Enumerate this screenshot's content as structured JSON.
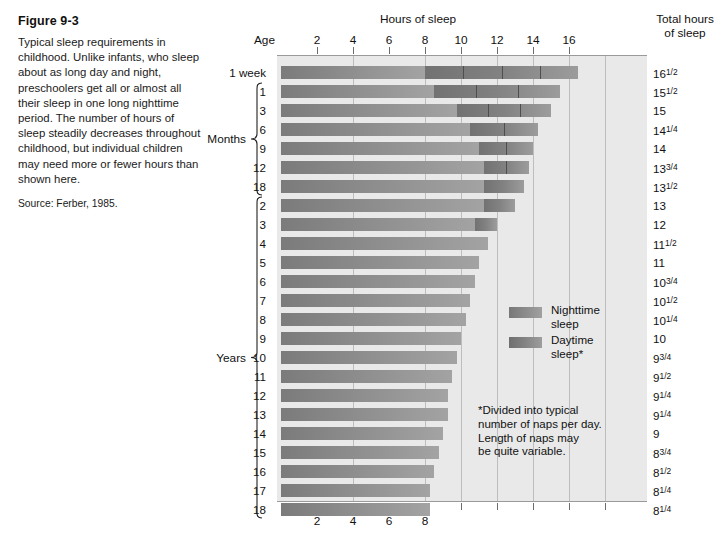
{
  "figure": {
    "title": "Figure 9-3",
    "body": "Typical sleep requirements in childhood. Unlike infants, who sleep about as long day and night, preschoolers get all or almost all their sleep in one long nighttime period. The number of hours of sleep steadily decreases throughout childhood, but individual children may need more or fewer hours than shown here.",
    "source": "Source: Ferber, 1985."
  },
  "headers": {
    "hours_of_sleep": "Hours of sleep",
    "age": "Age",
    "total_hours_line1": "Total hours",
    "total_hours_line2": "of sleep"
  },
  "legend": {
    "nighttime": "Nighttime\nsleep",
    "daytime": "Daytime\nsleep*"
  },
  "footnote": "*Divided into typical\nnumber of naps per day.\nLength of naps may\nbe quite variable.",
  "groups": [
    {
      "label": "Months",
      "first_row": 1,
      "last_row": 6
    },
    {
      "label": "Years",
      "first_row": 7,
      "last_row": 23
    }
  ],
  "colors": {
    "panel_background": "#e9e9e9",
    "nighttime_bar": "#8a8a8a",
    "daytime_bar": "#7d7d7d",
    "gridline": "#bdbdbd",
    "text": "#111111"
  },
  "chart_data": {
    "type": "bar",
    "title": "Hours of sleep",
    "xlabel": "Hours of sleep",
    "ylabel": "Age",
    "xlim": [
      0,
      20
    ],
    "xticks": [
      2,
      4,
      6,
      8,
      10,
      12,
      14,
      16
    ],
    "xticklabels": [
      "2",
      "4",
      "6",
      "8",
      "10",
      "12",
      "14",
      "16"
    ],
    "xticks_bottom": [
      2,
      4,
      6,
      8
    ],
    "xticklabels_bottom": [
      "2",
      "4",
      "6",
      "8"
    ],
    "grid": true,
    "stacked": true,
    "legend": [
      "Nighttime sleep",
      "Daytime sleep*"
    ],
    "legend_position": "center-right",
    "categories": [
      "1 week",
      "1",
      "3",
      "6",
      "9",
      "12",
      "18",
      "2",
      "3",
      "4",
      "5",
      "6",
      "7",
      "8",
      "9",
      "10",
      "11",
      "12",
      "13",
      "14",
      "15",
      "16",
      "17",
      "18"
    ],
    "rows": [
      {
        "age": "1 week",
        "unit": "weeks",
        "night": 8.0,
        "day": 8.5,
        "naps": 4,
        "total": 16.5,
        "total_label": "16",
        "total_frac_num": "1",
        "total_frac_den": "2"
      },
      {
        "age": "1",
        "unit": "months",
        "night": 8.5,
        "day": 7.0,
        "naps": 3,
        "total": 15.5,
        "total_label": "15",
        "total_frac_num": "1",
        "total_frac_den": "2"
      },
      {
        "age": "3",
        "unit": "months",
        "night": 9.75,
        "day": 5.25,
        "naps": 3,
        "total": 15.0,
        "total_label": "15",
        "total_frac_num": "",
        "total_frac_den": ""
      },
      {
        "age": "6",
        "unit": "months",
        "night": 10.5,
        "day": 3.75,
        "naps": 2,
        "total": 14.25,
        "total_label": "14",
        "total_frac_num": "1",
        "total_frac_den": "4"
      },
      {
        "age": "9",
        "unit": "months",
        "night": 11.0,
        "day": 3.0,
        "naps": 2,
        "total": 14.0,
        "total_label": "14",
        "total_frac_num": "",
        "total_frac_den": ""
      },
      {
        "age": "12",
        "unit": "months",
        "night": 11.25,
        "day": 2.5,
        "naps": 2,
        "total": 13.75,
        "total_label": "13",
        "total_frac_num": "3",
        "total_frac_den": "4"
      },
      {
        "age": "18",
        "unit": "months",
        "night": 11.25,
        "day": 2.25,
        "naps": 1,
        "total": 13.5,
        "total_label": "13",
        "total_frac_num": "1",
        "total_frac_den": "2"
      },
      {
        "age": "2",
        "unit": "years",
        "night": 11.25,
        "day": 1.75,
        "naps": 1,
        "total": 13.0,
        "total_label": "13",
        "total_frac_num": "",
        "total_frac_den": ""
      },
      {
        "age": "3",
        "unit": "years",
        "night": 10.75,
        "day": 1.25,
        "naps": 1,
        "total": 12.0,
        "total_label": "12",
        "total_frac_num": "",
        "total_frac_den": ""
      },
      {
        "age": "4",
        "unit": "years",
        "night": 11.5,
        "day": 0,
        "naps": 0,
        "total": 11.5,
        "total_label": "11",
        "total_frac_num": "1",
        "total_frac_den": "2"
      },
      {
        "age": "5",
        "unit": "years",
        "night": 11.0,
        "day": 0,
        "naps": 0,
        "total": 11.0,
        "total_label": "11",
        "total_frac_num": "",
        "total_frac_den": ""
      },
      {
        "age": "6",
        "unit": "years",
        "night": 10.75,
        "day": 0,
        "naps": 0,
        "total": 10.75,
        "total_label": "10",
        "total_frac_num": "3",
        "total_frac_den": "4"
      },
      {
        "age": "7",
        "unit": "years",
        "night": 10.5,
        "day": 0,
        "naps": 0,
        "total": 10.5,
        "total_label": "10",
        "total_frac_num": "1",
        "total_frac_den": "2"
      },
      {
        "age": "8",
        "unit": "years",
        "night": 10.25,
        "day": 0,
        "naps": 0,
        "total": 10.25,
        "total_label": "10",
        "total_frac_num": "1",
        "total_frac_den": "4"
      },
      {
        "age": "9",
        "unit": "years",
        "night": 10.0,
        "day": 0,
        "naps": 0,
        "total": 10.0,
        "total_label": "10",
        "total_frac_num": "",
        "total_frac_den": ""
      },
      {
        "age": "10",
        "unit": "years",
        "night": 9.75,
        "day": 0,
        "naps": 0,
        "total": 9.75,
        "total_label": "9",
        "total_frac_num": "3",
        "total_frac_den": "4"
      },
      {
        "age": "11",
        "unit": "years",
        "night": 9.5,
        "day": 0,
        "naps": 0,
        "total": 9.5,
        "total_label": "9",
        "total_frac_num": "1",
        "total_frac_den": "2"
      },
      {
        "age": "12",
        "unit": "years",
        "night": 9.25,
        "day": 0,
        "naps": 0,
        "total": 9.25,
        "total_label": "9",
        "total_frac_num": "1",
        "total_frac_den": "4"
      },
      {
        "age": "13",
        "unit": "years",
        "night": 9.25,
        "day": 0,
        "naps": 0,
        "total": 9.25,
        "total_label": "9",
        "total_frac_num": "1",
        "total_frac_den": "4"
      },
      {
        "age": "14",
        "unit": "years",
        "night": 9.0,
        "day": 0,
        "naps": 0,
        "total": 9.0,
        "total_label": "9",
        "total_frac_num": "",
        "total_frac_den": ""
      },
      {
        "age": "15",
        "unit": "years",
        "night": 8.75,
        "day": 0,
        "naps": 0,
        "total": 8.75,
        "total_label": "8",
        "total_frac_num": "3",
        "total_frac_den": "4"
      },
      {
        "age": "16",
        "unit": "years",
        "night": 8.5,
        "day": 0,
        "naps": 0,
        "total": 8.5,
        "total_label": "8",
        "total_frac_num": "1",
        "total_frac_den": "2"
      },
      {
        "age": "17",
        "unit": "years",
        "night": 8.25,
        "day": 0,
        "naps": 0,
        "total": 8.25,
        "total_label": "8",
        "total_frac_num": "1",
        "total_frac_den": "4"
      },
      {
        "age": "18",
        "unit": "years",
        "night": 8.25,
        "day": 0,
        "naps": 0,
        "total": 8.25,
        "total_label": "8",
        "total_frac_num": "1",
        "total_frac_den": "4"
      }
    ]
  }
}
